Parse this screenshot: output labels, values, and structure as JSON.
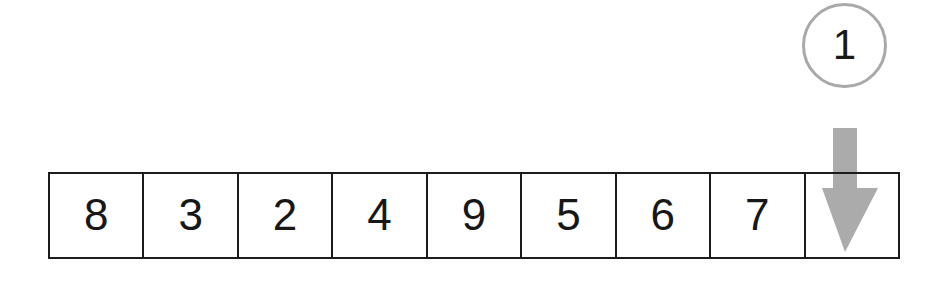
{
  "diagram": {
    "background_color": "#ffffff"
  },
  "step_badge": {
    "label": "1",
    "stroke_color": "#a9a9a9",
    "text_color": "#1a1a1a"
  },
  "pointer": {
    "icon": "arrow-down-icon",
    "direction": "down",
    "color": "#ababab",
    "target_cell_index": 8
  },
  "array": {
    "border_color": "#1c1c1c",
    "text_color": "#171717",
    "cells": [
      {
        "value": "8",
        "empty": false
      },
      {
        "value": "3",
        "empty": false
      },
      {
        "value": "2",
        "empty": false
      },
      {
        "value": "4",
        "empty": false
      },
      {
        "value": "9",
        "empty": false
      },
      {
        "value": "5",
        "empty": false
      },
      {
        "value": "6",
        "empty": false
      },
      {
        "value": "7",
        "empty": false
      },
      {
        "value": "",
        "empty": true
      }
    ]
  }
}
